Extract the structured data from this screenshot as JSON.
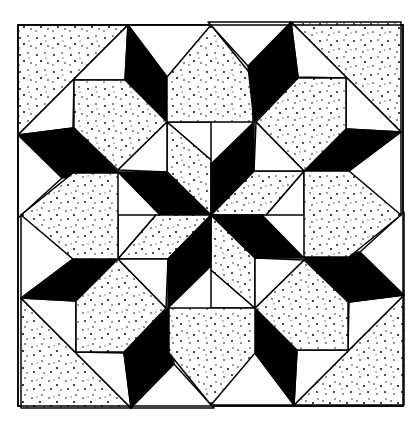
{
  "colors": {
    "ink": "#000000",
    "paper": "#ffffff"
  },
  "frame": {
    "x": 18,
    "y": 25,
    "w": 385,
    "h": 381
  },
  "center": {
    "x": 211,
    "y": 215
  }
}
